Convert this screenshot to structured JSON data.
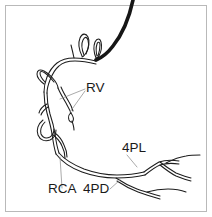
{
  "figure": {
    "kind": "coronary-angiogram-line-drawing",
    "background_color": "#ffffff",
    "border_color": "#b9b9b9",
    "vessel_color": "#1d1d1d",
    "catheter_color": "#161616",
    "leader_color": "#8d8d8d"
  },
  "labels": [
    {
      "id": "rv",
      "text": "RV",
      "x": 86,
      "y": 92,
      "anchor": "start"
    },
    {
      "id": "4pl",
      "text": "4PL",
      "x": 122,
      "y": 152,
      "anchor": "start"
    },
    {
      "id": "rca",
      "text": "RCA",
      "x": 48,
      "y": 193,
      "anchor": "start"
    },
    {
      "id": "4pd",
      "text": "4PD",
      "x": 83,
      "y": 193,
      "anchor": "start"
    }
  ],
  "leader_lines": [
    {
      "id": "rv-leader-upper",
      "d": "M 85,89 L 60,99"
    },
    {
      "id": "rv-leader-lower",
      "d": "M 85,91 L 70,112"
    },
    {
      "id": "4pl-leader",
      "d": "M 127,155 L 137,167"
    },
    {
      "id": "rca-leader",
      "d": "M 62,188 L 60,157"
    },
    {
      "id": "4pd-leader",
      "d": "M 110,189 L 120,180"
    }
  ],
  "catheter": {
    "id": "guide-catheter",
    "d": "M 133,0 C 130,14 124,32 113,46 C 107,54 101,58 96,60"
  },
  "vessels": [
    {
      "id": "rca-main-upper-outer",
      "d": "M 96,61 C 88,59 80,58 74,58 C 68,58 62,59 57,63 C 52,67 49,72 47,77 C 45,82 44,87 44,92"
    },
    {
      "id": "rca-main-upper-inner",
      "d": "M 96,64 C 88,62 81,61 75,61 C 69,61 63,62 59,66 C 54,70 52,75 50,80 C 48,85 47,89 47,93"
    },
    {
      "id": "rca-mid-outer",
      "d": "M 44,92 C 44,99 45,106 47,113 C 49,120 51,127 52,134 C 53,141 54,148 56,154"
    },
    {
      "id": "rca-mid-inner",
      "d": "M 47,93 C 47,100 48,107 50,114 C 52,120 54,127 55,134 C 56,141 57,147 59,153"
    },
    {
      "id": "rca-distal-outer",
      "d": "M 56,154 C 62,162 71,168 82,172 C 93,176 105,178 116,178 C 127,178 137,177 145,175"
    },
    {
      "id": "rca-distal-inner",
      "d": "M 59,153 C 65,160 74,165 84,169 C 95,173 106,175 117,175 C 127,175 136,174 144,172"
    },
    {
      "id": "pl-branch-outer",
      "d": "M 145,175 C 150,171 155,167 160,165 C 166,163 172,163 179,164"
    },
    {
      "id": "pl-branch-inner",
      "d": "M 144,172 C 149,168 154,165 159,162 C 165,160 172,160 179,161"
    },
    {
      "id": "pl-branch-2-outer",
      "d": "M 160,165 C 165,169 170,173 176,176 C 181,178 186,180 191,181"
    },
    {
      "id": "pl-branch-2-inner",
      "d": "M 160,162 C 165,166 171,170 176,173 C 181,175 186,177 191,178"
    },
    {
      "id": "pl-tip-upper",
      "d": "M 166,163 C 172,160 179,157 186,156 C 191,155 196,155 200,155"
    },
    {
      "id": "pd-branch-outer",
      "d": "M 116,178 C 122,182 129,186 137,189 C 145,192 153,194 160,196"
    },
    {
      "id": "pd-branch-inner",
      "d": "M 117,181 C 123,185 130,189 138,192 C 146,195 153,197 160,199"
    },
    {
      "id": "pd-tip",
      "d": "M 147,192 C 154,190 161,189 168,189 C 175,189 181,190 186,192"
    },
    {
      "id": "conus-loop-left-outer",
      "d": "M 82,56 C 79,50 78,43 80,38 C 82,33 86,33 88,37 C 90,41 89,48 86,53 C 84,56 83,57 82,57"
    },
    {
      "id": "conus-loop-left-inner",
      "d": "M 84,55 C 82,50 81,44 83,40 C 85,36 87,37 88,40 C 89,44 88,50 86,54"
    },
    {
      "id": "conus-loop-right-outer",
      "d": "M 96,58 C 94,53 93,47 95,42 C 97,38 100,38 101,42 C 102,46 101,52 99,56 C 98,58 97,58 96,58"
    },
    {
      "id": "conus-loop-right-inner",
      "d": "M 97,56 C 96,52 96,47 97,44 C 98,41 100,42 100,45 C 100,49 99,53 98,56"
    },
    {
      "id": "rv-loop-upper-outer",
      "d": "M 44,84 C 40,81 37,78 37,74 C 37,70 40,69 44,71 C 48,73 52,77 55,81 C 57,84 58,86 58,88"
    },
    {
      "id": "rv-loop-upper-inner",
      "d": "M 45,82 C 42,79 40,76 40,73 C 40,71 42,71 45,73 C 48,75 51,78 54,82"
    },
    {
      "id": "rv-branch-mid-a",
      "d": "M 58,88 C 60,93 63,98 66,103 C 68,107 70,110 71,113"
    },
    {
      "id": "rv-branch-mid-b",
      "d": "M 61,87 C 63,92 66,97 69,102 C 71,105 72,108 73,111"
    },
    {
      "id": "rv-branch-tip-loop",
      "d": "M 71,113 C 73,116 74,119 73,121 C 72,123 70,122 69,120 C 68,117 69,114 71,113"
    },
    {
      "id": "rv-branch-tip-stem",
      "d": "M 72,121 C 73,124 74,127 74,130"
    },
    {
      "id": "acute-loop-outer",
      "d": "M 43,120 C 38,124 36,130 38,135 C 40,140 45,142 50,140 C 54,138 56,134 56,130"
    },
    {
      "id": "acute-loop-inner",
      "d": "M 45,122 C 41,126 40,130 41,134 C 43,138 46,139 50,137 C 53,135 54,132 54,129"
    },
    {
      "id": "acute-marginal-outer",
      "d": "M 52,134 C 56,137 60,141 62,146 C 64,150 65,154 65,158"
    },
    {
      "id": "acute-marginal-inner",
      "d": "M 55,133 C 59,136 62,140 64,145 C 66,149 67,153 67,157"
    },
    {
      "id": "rv-small-side-a",
      "d": "M 47,104 C 43,106 40,109 39,113"
    },
    {
      "id": "rv-small-side-b",
      "d": "M 48,107 C 45,109 42,112 41,115"
    },
    {
      "id": "upper-stub",
      "d": "M 74,58 C 73,53 72,49 71,45"
    }
  ]
}
